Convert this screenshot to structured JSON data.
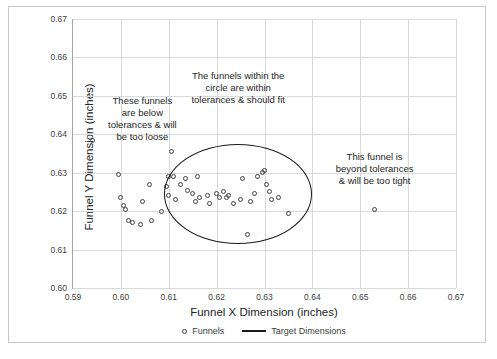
{
  "chart_data": {
    "type": "scatter",
    "title": "",
    "xlabel": "Funnel X Dimension (inches)",
    "ylabel": "Funnel Y Dimension (inches)",
    "xlim": [
      0.59,
      0.67
    ],
    "ylim": [
      0.6,
      0.67
    ],
    "xticks": [
      "0.59",
      "0.60",
      "0.61",
      "0.62",
      "0.63",
      "0.64",
      "0.65",
      "0.66",
      "0.67"
    ],
    "yticks": [
      "0.60",
      "0.61",
      "0.62",
      "0.63",
      "0.64",
      "0.65",
      "0.66",
      "0.67"
    ],
    "grid": true,
    "legend_position": "bottom",
    "series": [
      {
        "name": "Funnels",
        "marker": "open-circle",
        "color": "#404040",
        "points": [
          [
            0.594,
            0.6385
          ],
          [
            0.5995,
            0.6295
          ],
          [
            0.6,
            0.6235
          ],
          [
            0.6005,
            0.6215
          ],
          [
            0.601,
            0.6205
          ],
          [
            0.6015,
            0.6175
          ],
          [
            0.6025,
            0.617
          ],
          [
            0.604,
            0.6165
          ],
          [
            0.6045,
            0.6225
          ],
          [
            0.606,
            0.627
          ],
          [
            0.6065,
            0.6175
          ],
          [
            0.6085,
            0.62
          ],
          [
            0.6095,
            0.6265
          ],
          [
            0.61,
            0.629
          ],
          [
            0.61,
            0.624
          ],
          [
            0.6105,
            0.6355
          ],
          [
            0.611,
            0.629
          ],
          [
            0.6115,
            0.623
          ],
          [
            0.6125,
            0.627
          ],
          [
            0.6135,
            0.6285
          ],
          [
            0.614,
            0.6255
          ],
          [
            0.615,
            0.6245
          ],
          [
            0.6155,
            0.6225
          ],
          [
            0.616,
            0.629
          ],
          [
            0.6165,
            0.6235
          ],
          [
            0.618,
            0.624
          ],
          [
            0.6185,
            0.622
          ],
          [
            0.62,
            0.6245
          ],
          [
            0.6205,
            0.6235
          ],
          [
            0.6215,
            0.625
          ],
          [
            0.622,
            0.6235
          ],
          [
            0.6225,
            0.624
          ],
          [
            0.6235,
            0.622
          ],
          [
            0.625,
            0.623
          ],
          [
            0.6255,
            0.6285
          ],
          [
            0.6265,
            0.614
          ],
          [
            0.627,
            0.6225
          ],
          [
            0.628,
            0.6245
          ],
          [
            0.6285,
            0.629
          ],
          [
            0.6295,
            0.63
          ],
          [
            0.63,
            0.6305
          ],
          [
            0.6305,
            0.627
          ],
          [
            0.631,
            0.625
          ],
          [
            0.6315,
            0.623
          ],
          [
            0.633,
            0.6235
          ],
          [
            0.635,
            0.6195
          ],
          [
            0.653,
            0.6205
          ]
        ]
      },
      {
        "name": "Target Dimensions",
        "marker": "line",
        "color": "#1a1a1a",
        "shape": "circle",
        "center": [
          0.6245,
          0.6245
        ],
        "radius_x": 0.0155,
        "radius_y": 0.013
      }
    ],
    "annotations": [
      {
        "id": "too-loose",
        "text": "These funnels\nare below\ntolerances & will\nbe too loose",
        "x": 0.6045,
        "y": 0.644
      },
      {
        "id": "within-tolerance",
        "text": "The funnels within the\ncircle are within\ntolerances & should  fit",
        "x": 0.6245,
        "y": 0.652
      },
      {
        "id": "too-tight",
        "text": "This funnel is\nbeyond tolerances\n& will be too tight",
        "x": 0.653,
        "y": 0.631
      }
    ]
  },
  "legend": {
    "entries": [
      {
        "label": "Funnels",
        "marker": "open-circle"
      },
      {
        "label": "Target Dimensions",
        "marker": "line"
      }
    ]
  }
}
